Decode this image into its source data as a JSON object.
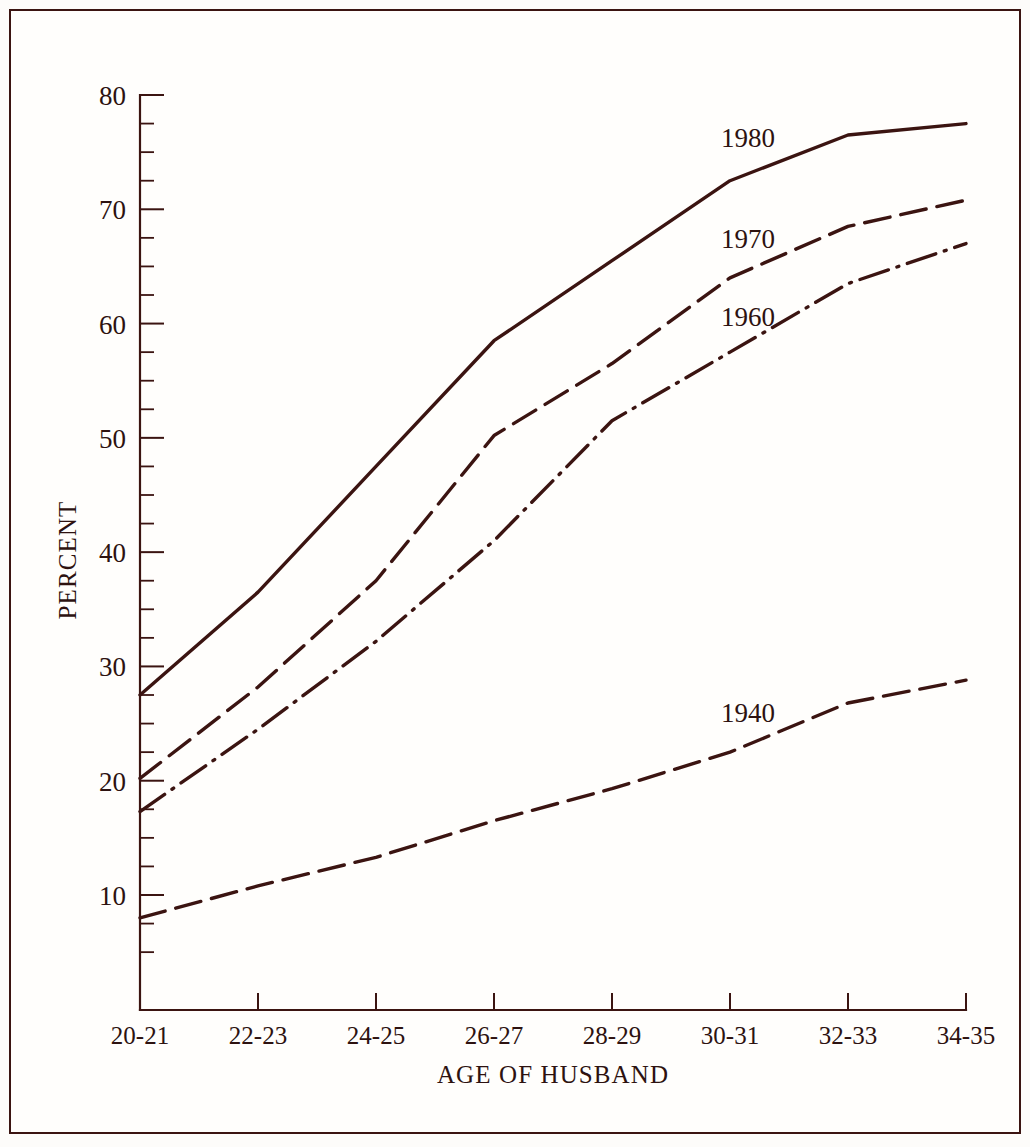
{
  "figure": {
    "background_color": "#fdfcfa",
    "ink_color": "#3b1411",
    "border_color": "#3b1411"
  },
  "chart_data": {
    "type": "line",
    "title": "",
    "xlabel": "AGE OF HUSBAND",
    "ylabel": "PERCENT",
    "categories": [
      "20-21",
      "22-23",
      "24-25",
      "26-27",
      "28-29",
      "30-31",
      "32-33",
      "34-35"
    ],
    "ylim": [
      5,
      80
    ],
    "y_major_ticks": [
      10,
      20,
      30,
      40,
      50,
      60,
      70,
      80
    ],
    "y_minor_interval": 2.5,
    "grid": false,
    "legend_position": "inline-labels",
    "series": [
      {
        "name": "1980",
        "line_style": "solid",
        "label_x_category": "30-31",
        "values": [
          27.5,
          36.5,
          47.5,
          58.5,
          65.5,
          72.5,
          76.5,
          77.5
        ]
      },
      {
        "name": "1970",
        "line_style": "dashed",
        "label_x_category": "30-31",
        "values": [
          20.2,
          28.2,
          37.5,
          50.2,
          56.5,
          64.0,
          68.5,
          70.8
        ]
      },
      {
        "name": "1960",
        "line_style": "dash-dot",
        "label_x_category": "30-31",
        "values": [
          17.3,
          24.5,
          32.2,
          41.0,
          51.5,
          57.5,
          63.5,
          67.0
        ]
      },
      {
        "name": "1940",
        "line_style": "dashed",
        "label_x_category": "30-31",
        "values": [
          8.0,
          10.8,
          13.3,
          16.5,
          19.3,
          22.5,
          26.8,
          28.8
        ]
      }
    ]
  },
  "axes": {
    "y_tick_labels": [
      "80",
      "70",
      "60",
      "50",
      "40",
      "30",
      "20",
      "10"
    ],
    "x_tick_labels": [
      "20-21",
      "22-23",
      "24-25",
      "26-27",
      "28-29",
      "30-31",
      "32-33",
      "34-35"
    ],
    "y_axis_title": "PERCENT",
    "x_axis_title": "AGE OF HUSBAND"
  },
  "series_labels": {
    "s1980": "1980",
    "s1970": "1970",
    "s1960": "1960",
    "s1940": "1940"
  }
}
